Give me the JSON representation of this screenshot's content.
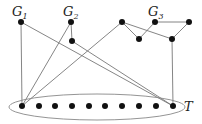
{
  "diagram": {
    "labels": {
      "g1": "G",
      "g1_sub": "1",
      "g2": "G",
      "g2_sub": "2",
      "g3": "G",
      "g3_sub": "3",
      "t": "T"
    },
    "colors": {
      "node": "#111111",
      "edge": "#777777",
      "ellipse": "#888888"
    },
    "nodes": {
      "g1": [
        21,
        22
      ],
      "g2_top": [
        71,
        22
      ],
      "g2_bottom": [
        72,
        41
      ],
      "g3_a": [
        122,
        22
      ],
      "g3_b": [
        139,
        39
      ],
      "g3_c": [
        155,
        22
      ],
      "g3_d": [
        189,
        22
      ],
      "g3_e": [
        172,
        39
      ],
      "t": [
        [
          22,
          106
        ],
        [
          39,
          106
        ],
        [
          55,
          106
        ],
        [
          72,
          106
        ],
        [
          89,
          106
        ],
        [
          105,
          106
        ],
        [
          122,
          106
        ],
        [
          139,
          106
        ],
        [
          156,
          106
        ],
        [
          173,
          106
        ]
      ]
    },
    "edges": [
      [
        "g1",
        "t0"
      ],
      [
        "g1",
        "t9"
      ],
      [
        "g2_top",
        "g2_bottom"
      ],
      [
        "g2_top",
        "t0"
      ],
      [
        "g2_bottom",
        "t9"
      ],
      [
        "g3_a",
        "g3_b"
      ],
      [
        "g3_b",
        "g3_c"
      ],
      [
        "g3_c",
        "g3_d"
      ],
      [
        "g3_d",
        "g3_e"
      ],
      [
        "g3_a",
        "g3_e"
      ],
      [
        "g3_a",
        "t0"
      ],
      [
        "g3_e",
        "t9"
      ]
    ]
  }
}
